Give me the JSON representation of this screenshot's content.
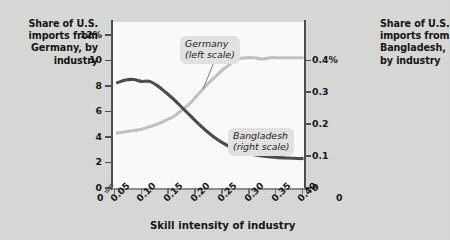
{
  "figure": {
    "left_axis_title": "Share of U.S. imports from Germany, by industry",
    "right_axis_title": "Share of U.S. imports from Bangladesh, by industry",
    "x_axis_title": "Skill intensity of industry",
    "x_origin_label": "0",
    "x_right_origin_label": "0",
    "axis_break_glyph": "//",
    "colors": {
      "background": "#d9d9d7",
      "plot_background": "#ffffff",
      "germany_line": "#c3c3c3",
      "bangladesh_line": "#4a4a4a",
      "axis": "#4b4b4b",
      "label_chip": "#e4e4e2"
    }
  },
  "chart_data": {
    "type": "line",
    "title": "",
    "subtitle": "",
    "xlabel": "Skill intensity of industry",
    "ylabel": "Share of U.S. imports from Germany, by industry",
    "y2label": "Share of U.S. imports from Bangladesh, by industry",
    "grid": false,
    "legend_position": "inline-annotation",
    "xlim": [
      0.045,
      0.405
    ],
    "x_ticks": [
      0.05,
      0.1,
      0.15,
      0.2,
      0.25,
      0.3,
      0.35,
      0.4
    ],
    "x_tick_labels": [
      "0.05",
      "0.10",
      "0.15",
      "0.20",
      "0.25",
      "0.30",
      "0.35",
      "0.40"
    ],
    "x_axis_has_break": true,
    "ylim": [
      0,
      13
    ],
    "y_ticks": [
      0,
      2,
      4,
      6,
      8,
      10,
      12
    ],
    "y_tick_labels": [
      "0",
      "2",
      "4",
      "6",
      "8",
      "10",
      "12%"
    ],
    "y2lim": [
      0,
      0.52
    ],
    "y2_ticks": [
      0,
      0.1,
      0.2,
      0.3,
      0.4
    ],
    "y2_tick_labels": [
      "0",
      "0.1",
      "0.2",
      "0.3",
      "0.4%"
    ],
    "series": [
      {
        "name": "Germany",
        "scale": "left",
        "annotation": "Germany\n(left scale)",
        "color": "#c3c3c3",
        "x": [
          0.055,
          0.07,
          0.085,
          0.1,
          0.115,
          0.13,
          0.145,
          0.16,
          0.175,
          0.19,
          0.205,
          0.22,
          0.235,
          0.25,
          0.265,
          0.28,
          0.295,
          0.31,
          0.325,
          0.34,
          0.355,
          0.37,
          0.385,
          0.4
        ],
        "values": [
          4.3,
          4.4,
          4.5,
          4.6,
          4.8,
          5.0,
          5.3,
          5.6,
          6.1,
          6.6,
          7.3,
          8.0,
          8.6,
          9.2,
          9.7,
          10.1,
          10.2,
          10.2,
          10.1,
          10.2,
          10.2,
          10.2,
          10.2,
          10.2
        ]
      },
      {
        "name": "Bangladesh",
        "scale": "right",
        "annotation": "Bangladesh\n(right scale)",
        "color": "#4a4a4a",
        "x": [
          0.055,
          0.07,
          0.085,
          0.1,
          0.115,
          0.13,
          0.145,
          0.16,
          0.175,
          0.19,
          0.205,
          0.22,
          0.235,
          0.25,
          0.265,
          0.28,
          0.295,
          0.31,
          0.325,
          0.34,
          0.355,
          0.37,
          0.385,
          0.4
        ],
        "values": [
          0.33,
          0.338,
          0.34,
          0.334,
          0.334,
          0.32,
          0.3,
          0.278,
          0.253,
          0.228,
          0.203,
          0.18,
          0.16,
          0.143,
          0.129,
          0.118,
          0.11,
          0.104,
          0.1,
          0.097,
          0.095,
          0.094,
          0.093,
          0.092
        ]
      }
    ],
    "annotations": [
      {
        "text": "Germany (left scale)",
        "series": "Germany",
        "leader_to_x": 0.215
      },
      {
        "text": "Bangladesh (right scale)",
        "series": "Bangladesh",
        "leader_to_x": 0.268
      }
    ]
  },
  "y_ticks_left": [
    {
      "label": "12%",
      "value": 12
    },
    {
      "label": "10",
      "value": 10
    },
    {
      "label": "8",
      "value": 8
    },
    {
      "label": "6",
      "value": 6
    },
    {
      "label": "4",
      "value": 4
    },
    {
      "label": "2",
      "value": 2
    },
    {
      "label": "0",
      "value": 0
    }
  ],
  "y_ticks_right": [
    {
      "label": "0.4%",
      "value": 0.4
    },
    {
      "label": "0.3",
      "value": 0.3
    },
    {
      "label": "0.2",
      "value": 0.2
    },
    {
      "label": "0.1",
      "value": 0.1
    },
    {
      "label": "0",
      "value": 0
    }
  ],
  "x_ticks": [
    {
      "label": "0.05",
      "value": 0.05
    },
    {
      "label": "0.10",
      "value": 0.1
    },
    {
      "label": "0.15",
      "value": 0.15
    },
    {
      "label": "0.20",
      "value": 0.2
    },
    {
      "label": "0.25",
      "value": 0.25
    },
    {
      "label": "0.30",
      "value": 0.3
    },
    {
      "label": "0.35",
      "value": 0.35
    },
    {
      "label": "0.40",
      "value": 0.4
    }
  ],
  "series_labels": {
    "germany_line1": "Germany",
    "germany_line2": "(left scale)",
    "bangladesh_line1": "Bangladesh",
    "bangladesh_line2": "(right scale)"
  }
}
